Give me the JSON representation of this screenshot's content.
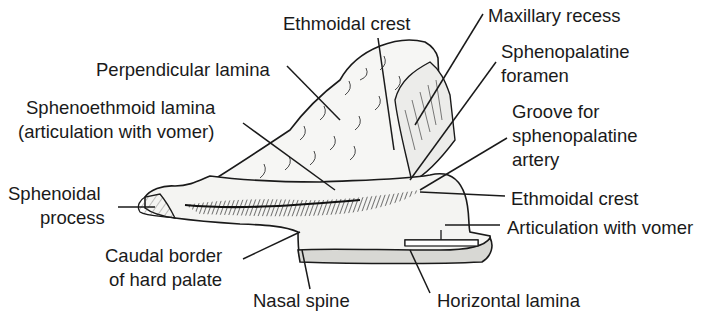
{
  "figure": {
    "colors": {
      "ink": "#1a1a1a",
      "background": "#ffffff",
      "bone_fill": "#f4f4f2",
      "shadow": "#2a2a2a"
    }
  },
  "labels": {
    "ethmoidal_crest_top": "Ethmoidal crest",
    "maxillary_recess": "Maxillary recess",
    "perpendicular_lamina": "Perpendicular lamina",
    "sphenopalatine_foramen_1": "Sphenopalatine",
    "sphenopalatine_foramen_2": "foramen",
    "sphenoethmoid_lamina_1": "Sphenoethmoid lamina",
    "sphenoethmoid_lamina_2": "(articulation with vomer)",
    "groove_1": "Groove for",
    "groove_2": "sphenopalatine",
    "groove_3": "artery",
    "sphenoidal_process_1": "Sphenoidal",
    "sphenoidal_process_2": "process",
    "ethmoidal_crest_lower": "Ethmoidal crest",
    "articulation_with_vomer": "Articulation with vomer",
    "caudal_border_1": "Caudal border",
    "caudal_border_2": "of hard palate",
    "nasal_spine": "Nasal spine",
    "horizontal_lamina": "Horizontal lamina"
  }
}
